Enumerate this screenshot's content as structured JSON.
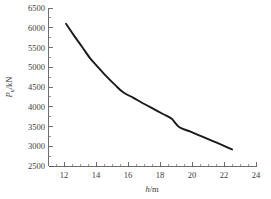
{
  "chart_data": {
    "type": "line",
    "title": "",
    "subtitle": "",
    "xlabel": "h/m",
    "xlabel_var": "h",
    "xlabel_rest": "/m",
    "ylabel": "Pu/kN",
    "ylabel_var": "P",
    "ylabel_sub": "u",
    "ylabel_rest": "/kN",
    "xlim": [
      11,
      24
    ],
    "ylim": [
      2500,
      6500
    ],
    "xticks": [
      12,
      14,
      16,
      18,
      20,
      22,
      24
    ],
    "xtick_labels": [
      "12",
      "14",
      "16",
      "18",
      "20",
      "22",
      "24"
    ],
    "yticks": [
      2500,
      3000,
      3500,
      4000,
      4500,
      5000,
      5500,
      6000,
      6500
    ],
    "ytick_labels": [
      "2500",
      "3000",
      "3500",
      "4000",
      "4500",
      "5000",
      "5500",
      "6000",
      "6500"
    ],
    "x_minor_interval": 0.5,
    "y_minor_interval": 250,
    "grid": false,
    "legend": false,
    "legend_position": "none",
    "series": [
      {
        "name": "Pu",
        "color": "#1a1a1a",
        "x": [
          12.1,
          12.6,
          13.1,
          13.6,
          14.0,
          14.6,
          15.2,
          15.7,
          16.3,
          17.0,
          17.6,
          18.2,
          18.7,
          19.2,
          19.9,
          20.6,
          21.3,
          22.0,
          22.5
        ],
        "y": [
          6100,
          5800,
          5520,
          5230,
          5050,
          4780,
          4540,
          4360,
          4230,
          4070,
          3940,
          3810,
          3700,
          3480,
          3370,
          3250,
          3130,
          3010,
          2920
        ]
      }
    ]
  },
  "axes": {
    "x_axis_name": "x-axis",
    "y_axis_name": "y-axis"
  }
}
